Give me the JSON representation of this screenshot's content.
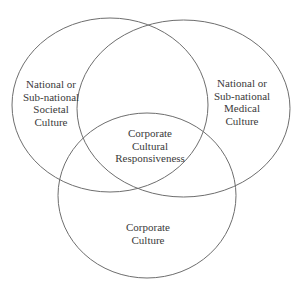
{
  "diagram": {
    "type": "venn",
    "colors": {
      "stroke": "#6e6e6e",
      "text": "#3a3a3a",
      "background": "#ffffff"
    },
    "sets": [
      {
        "id": "societal",
        "lines": [
          "National or",
          "Sub-national",
          "Societal",
          "Culture"
        ]
      },
      {
        "id": "medical",
        "lines": [
          "National or",
          "Sub-national",
          "Medical",
          "Culture"
        ]
      },
      {
        "id": "corporate",
        "lines": [
          "Corporate",
          "Culture"
        ]
      }
    ],
    "intersection": {
      "id": "center",
      "lines": [
        "Corporate",
        "Cultural",
        "Responsiveness"
      ]
    }
  }
}
